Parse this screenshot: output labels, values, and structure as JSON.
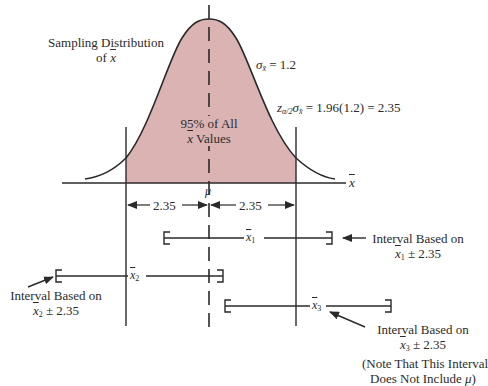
{
  "diagram": {
    "title_line1": "Sampling Distribution",
    "title_line2_prefix": "of ",
    "title_line2_var": "x",
    "sigma_label": "σ",
    "sigma_sub": "x̄",
    "sigma_value": " = 1.2",
    "margin_prefix": "z",
    "margin_sub1": "α/2",
    "margin_sigma": "σ",
    "margin_sub2": "x̄",
    "margin_value": " = 1.96(1.2) = 2.35",
    "center_text_line1": "95% of All",
    "center_text_line2_var": "x",
    "center_text_line2_suffix": " Values",
    "mu_label": "μ",
    "axis_label": "x",
    "left_half_width": "2.35",
    "right_half_width": "2.35",
    "colors": {
      "shade": "#dcb3b3",
      "line": "#2a2a2a",
      "background": "#ffffff"
    }
  },
  "intervals": [
    {
      "name": "x̄1",
      "var": "x",
      "sub": "1",
      "annotation_line1": "Interval Based on",
      "annotation_line2_var": "x",
      "annotation_line2_sub": "1",
      "annotation_line2_suffix": " ± 2.35"
    },
    {
      "name": "x̄2",
      "var": "x",
      "sub": "2",
      "annotation_line1": "Interval Based on",
      "annotation_line2_var": "x",
      "annotation_line2_sub": "2",
      "annotation_line2_suffix": " ± 2.35"
    },
    {
      "name": "x̄3",
      "var": "x",
      "sub": "3",
      "annotation_line1": "Interval Based on",
      "annotation_line2_var": "x",
      "annotation_line2_sub": "3",
      "annotation_line2_suffix": " ± 2.35",
      "note_line1": "(Note That This Interval",
      "note_line2_prefix": "Does Not Include ",
      "note_line2_var": "μ",
      "note_line2_suffix": ")"
    }
  ]
}
